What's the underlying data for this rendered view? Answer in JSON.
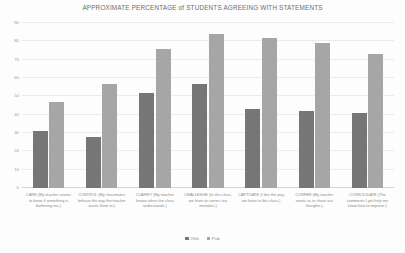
{
  "chart_data": {
    "type": "bar",
    "title": "APPROXIMATE PERCENTAGE of STUDENTS AGREEING WITH STATEMENTS",
    "xlabel": "",
    "ylabel": "",
    "ylim": [
      0,
      90
    ],
    "yticks": [
      90,
      80,
      70,
      60,
      50,
      40,
      30,
      20,
      10,
      0
    ],
    "grid": true,
    "legend_position": "bottom",
    "categories": [
      "CARE (My teacher seems to know if something is bothering me.)",
      "CONTROL (My classmates behave the way the teacher wants them to.)",
      "CLARIFY (My teacher knows when the class understands.)",
      "CHALLENGE (In this class, we learn to correct our mistakes.)",
      "CAPTIVATE (I like the way we learn in this class.)",
      "CONFER (My teacher wants us to share our thoughts.)",
      "CONSOLIDATE (The comments I get help me know how to improve.)"
    ],
    "series": [
      {
        "name": "25th",
        "color": "#767676",
        "values": [
          31,
          28,
          52,
          57,
          43,
          42,
          41
        ]
      },
      {
        "name": "Pub",
        "color": "#a6a6a6",
        "values": [
          47,
          57,
          76,
          84,
          82,
          79,
          73
        ]
      }
    ]
  }
}
